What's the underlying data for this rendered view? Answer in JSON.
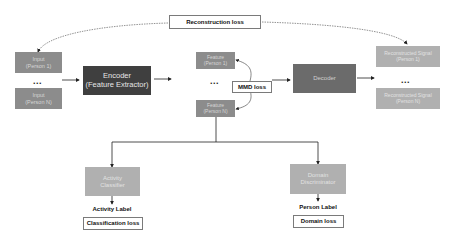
{
  "diagram": {
    "losses": {
      "reconstruction": "Reconstruction loss",
      "mmd": "MMD loss",
      "classification": "Classification loss",
      "domain": "Domain loss"
    },
    "inputs": [
      {
        "line1": "Input",
        "line2": "(Person 1)"
      },
      {
        "line1": "Input",
        "line2": "(Person N)"
      }
    ],
    "encoder": {
      "line1": "Encoder",
      "line2": "(Feature Extractor)"
    },
    "features": [
      {
        "line1": "Feature",
        "line2": "(Person 1)"
      },
      {
        "line1": "Feature",
        "line2": "(Person N)"
      }
    ],
    "decoder": {
      "label": "Decoder"
    },
    "reconstructed": [
      {
        "line1": "Reconstructed Signal",
        "line2": "(Person 1)"
      },
      {
        "line1": "Reconstructed Signal",
        "line2": "(Person N)"
      }
    ],
    "activity_classifier": {
      "line1": "Activity",
      "line2": "Classifier"
    },
    "domain_discriminator": {
      "line1": "Domain",
      "line2": "Discriminator"
    },
    "labels": {
      "activity": "Activity Label",
      "person": "Person Label"
    },
    "ellipsis": "...",
    "colors": {
      "input_box": "#8c8c8c",
      "encoder_box": "#3f3f3f",
      "feature_box": "#8c8c8c",
      "decoder_box": "#6b6b6b",
      "reconstructed_box": "#b0b0b0",
      "classifier_box": "#b0b0b0",
      "discriminator_box": "#b0b0b0"
    }
  }
}
